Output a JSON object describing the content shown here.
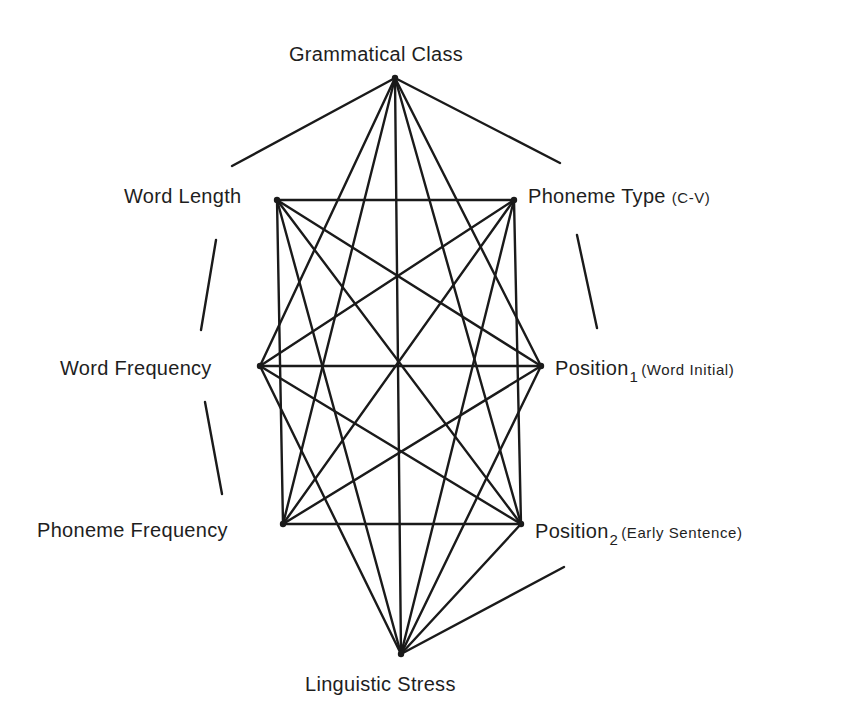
{
  "diagram": {
    "type": "network-graph",
    "nodes": [
      {
        "id": "gc",
        "label": "Grammatical Class",
        "x": 395,
        "y": 78
      },
      {
        "id": "wl",
        "label": "Word Length",
        "x": 277,
        "y": 200
      },
      {
        "id": "pt",
        "label": "Phoneme Type",
        "qualifier": "(C-V)",
        "x": 514,
        "y": 200
      },
      {
        "id": "wf",
        "label": "Word Frequency",
        "x": 260,
        "y": 366
      },
      {
        "id": "p1",
        "label": "Position",
        "subscript": "1",
        "qualifier": "(Word Initial)",
        "x": 541,
        "y": 366
      },
      {
        "id": "pf",
        "label": "Phoneme Frequency",
        "x": 283,
        "y": 524
      },
      {
        "id": "p2",
        "label": "Position",
        "subscript": "2",
        "qualifier": "(Early Sentence)",
        "x": 521,
        "y": 524
      },
      {
        "id": "ls",
        "label": "Linguistic Stress",
        "x": 401,
        "y": 654
      }
    ],
    "edges": [
      [
        "gc",
        "wf"
      ],
      [
        "gc",
        "pf"
      ],
      [
        "gc",
        "ls"
      ],
      [
        "gc",
        "p1"
      ],
      [
        "gc",
        "p2"
      ],
      [
        "wl",
        "pt"
      ],
      [
        "wl",
        "p1"
      ],
      [
        "wl",
        "p2"
      ],
      [
        "wl",
        "pf"
      ],
      [
        "wl",
        "ls"
      ],
      [
        "pt",
        "wf"
      ],
      [
        "pt",
        "pf"
      ],
      [
        "pt",
        "ls"
      ],
      [
        "pt",
        "p2"
      ],
      [
        "wf",
        "p1"
      ],
      [
        "wf",
        "p2"
      ],
      [
        "wf",
        "ls"
      ],
      [
        "p1",
        "pf"
      ],
      [
        "p1",
        "ls"
      ],
      [
        "pf",
        "p2"
      ],
      [
        "p2",
        "ls"
      ]
    ],
    "perimeter_strokes": [
      {
        "from": [
          395,
          78
        ],
        "to": [
          232,
          166
        ]
      },
      {
        "from": [
          395,
          78
        ],
        "to": [
          560,
          163
        ]
      },
      {
        "from": [
          216,
          240
        ],
        "to": [
          201,
          330
        ]
      },
      {
        "from": [
          205,
          402
        ],
        "to": [
          222,
          494
        ]
      },
      {
        "from": [
          577,
          235
        ],
        "to": [
          597,
          328
        ]
      },
      {
        "from": [
          564,
          567
        ],
        "to": [
          401,
          654
        ]
      }
    ],
    "color": "#1a1a1a"
  },
  "labels": {
    "gc": {
      "text": "Grammatical Class"
    },
    "wl": {
      "text": "Word Length"
    },
    "pt": {
      "text": "Phoneme Type",
      "qualifier": "(C-V)"
    },
    "wf": {
      "text": "Word Frequency"
    },
    "p1": {
      "text": "Position",
      "subscript": "1",
      "qualifier": "(Word Initial)"
    },
    "pf": {
      "text": "Phoneme Frequency"
    },
    "p2": {
      "text": "Position",
      "subscript": "2",
      "qualifier": "(Early Sentence)"
    },
    "ls": {
      "text": "Linguistic Stress"
    }
  }
}
